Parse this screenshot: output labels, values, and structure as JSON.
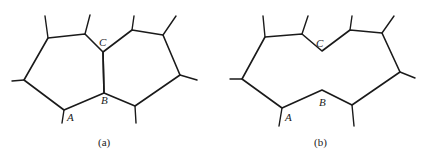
{
  "figure": {
    "panels": [
      {
        "id": "a",
        "caption": "(a)",
        "description": "Two adjacent grains separated by boundary B-C",
        "grains": [
          {
            "name": "left-grain",
            "hatch": "square-grid",
            "vertices": [
              [
                48,
                38
              ],
              [
                85,
                34
              ],
              [
                103,
                52
              ],
              [
                104,
                93
              ],
              [
                64,
                110
              ],
              [
                24,
                80
              ]
            ]
          },
          {
            "name": "right-grain",
            "hatch": "diagonal-grid",
            "vertices": [
              [
                103,
                52
              ],
              [
                132,
                30
              ],
              [
                163,
                35
              ],
              [
                180,
                75
              ],
              [
                135,
                106
              ],
              [
                104,
                93
              ]
            ]
          }
        ],
        "spokes": [
          [
            [
              48,
              38
            ],
            [
              45,
              16
            ]
          ],
          [
            [
              85,
              34
            ],
            [
              90,
              15
            ]
          ],
          [
            [
              24,
              80
            ],
            [
              12,
              81
            ]
          ],
          [
            [
              64,
              110
            ],
            [
              62,
              123
            ]
          ],
          [
            [
              132,
              30
            ],
            [
              134,
              16
            ]
          ],
          [
            [
              163,
              35
            ],
            [
              176,
              16
            ]
          ],
          [
            [
              180,
              75
            ],
            [
              197,
              80
            ]
          ],
          [
            [
              135,
              106
            ],
            [
              136,
              123
            ]
          ]
        ],
        "labels": [
          {
            "text": "C",
            "x": 99,
            "y": 46
          },
          {
            "text": "B",
            "x": 101,
            "y": 104
          },
          {
            "text": "A",
            "x": 67,
            "y": 121
          }
        ],
        "caption_pos": [
          98,
          146
        ]
      },
      {
        "id": "b",
        "caption": "(b)",
        "description": "Grains merged after boundary B-C removed",
        "grains": [
          {
            "name": "merged-grain",
            "hatch": "diagonal-grid",
            "vertices": [
              [
                265,
                37
              ],
              [
                302,
                34
              ],
              [
                322,
                51
              ],
              [
                350,
                30
              ],
              [
                382,
                33
              ],
              [
                400,
                72
              ],
              [
                352,
                105
              ],
              [
                322,
                90
              ],
              [
                282,
                108
              ],
              [
                242,
                79
              ]
            ]
          }
        ],
        "spokes": [
          [
            [
              265,
              37
            ],
            [
              263,
              16
            ]
          ],
          [
            [
              302,
              34
            ],
            [
              308,
              16
            ]
          ],
          [
            [
              350,
              30
            ],
            [
              352,
              16
            ]
          ],
          [
            [
              382,
              33
            ],
            [
              394,
              16
            ]
          ],
          [
            [
              400,
              72
            ],
            [
              415,
              78
            ]
          ],
          [
            [
              352,
              105
            ],
            [
              354,
              126
            ]
          ],
          [
            [
              282,
              108
            ],
            [
              279,
              126
            ]
          ],
          [
            [
              242,
              79
            ],
            [
              230,
              79
            ]
          ]
        ],
        "labels": [
          {
            "text": "C",
            "x": 316,
            "y": 47
          },
          {
            "text": "B",
            "x": 319,
            "y": 106
          },
          {
            "text": "A",
            "x": 285,
            "y": 121
          }
        ],
        "caption_pos": [
          314,
          146
        ]
      }
    ],
    "colors": {
      "line": "#1a1a1a",
      "hatch": "#6a6a6a",
      "background": "#ffffff"
    }
  }
}
